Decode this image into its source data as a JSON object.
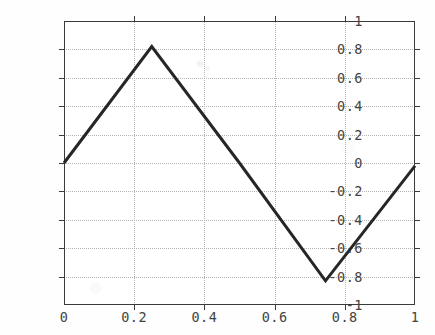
{
  "chart_data": {
    "type": "line",
    "title": "",
    "subtitle": "",
    "xlabel": "",
    "ylabel": "",
    "xlim": [
      0,
      1
    ],
    "ylim": [
      -1,
      1
    ],
    "grid": true,
    "legend": null,
    "legend_position": "none",
    "x_ticks": [
      0,
      0.2,
      0.4,
      0.6,
      0.8,
      1
    ],
    "x_tick_labels": [
      "0",
      "0.2",
      "0.4",
      "0.6",
      "0.8",
      "1"
    ],
    "y_ticks": [
      -1,
      -0.8,
      -0.6,
      -0.4,
      -0.2,
      0,
      0.2,
      0.4,
      0.6,
      0.8,
      1
    ],
    "y_tick_labels": [
      "-1",
      "-0.8",
      "-0.6",
      "-0.4",
      "-0.2",
      "0",
      "0.2",
      "0.4",
      "0.6",
      "0.8",
      "1"
    ],
    "series": [
      {
        "name": "triangle-wave",
        "color": "#262626",
        "line_width": 3,
        "x": [
          0,
          0.25,
          0.5,
          0.745,
          1
        ],
        "values": [
          0.0,
          0.82,
          0.0,
          -0.83,
          -0.02
        ]
      }
    ]
  },
  "axes": {
    "line_color": "#3b3b3b",
    "grid_color": "#b4b4b4",
    "tick_label_color": "#444444"
  },
  "figure": {
    "background": "#fefefe",
    "plot_background": "#ffffff"
  }
}
